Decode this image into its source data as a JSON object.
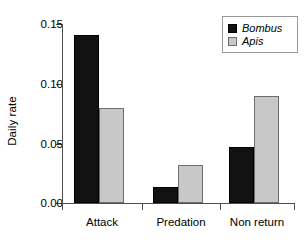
{
  "chart_data": {
    "type": "bar",
    "title": "",
    "subtitle": "",
    "xlabel": "",
    "ylabel": "Daily rate",
    "categories": [
      "Attack",
      "Predation",
      "Non return"
    ],
    "series": [
      {
        "name": "Bombus",
        "color": "#121212",
        "values": [
          0.141,
          0.013,
          0.047
        ]
      },
      {
        "name": "Apis",
        "color": "#c8c8c8",
        "values": [
          0.08,
          0.032,
          0.09
        ]
      }
    ],
    "ylim": [
      0.0,
      0.15
    ],
    "yticks": [
      0.0,
      0.05,
      0.1,
      0.15
    ],
    "ytick_labels": [
      "0.00",
      "0.05",
      "0.10",
      "0.15"
    ],
    "grid": false,
    "legend_position": "top-right",
    "legend_italic": true
  },
  "axis": {
    "y_label": "Daily rate",
    "y_ticks": [
      {
        "label": "0.15",
        "value": 0.15
      },
      {
        "label": "0.10",
        "value": 0.1
      },
      {
        "label": "0.05",
        "value": 0.05
      },
      {
        "label": "0.00",
        "value": 0.0
      }
    ],
    "x_categories": [
      {
        "label": "Attack"
      },
      {
        "label": "Predation"
      },
      {
        "label": "Non return"
      }
    ]
  },
  "legend": {
    "entries": [
      {
        "label": "Bombus",
        "swatch": "dark-square-icon",
        "color": "#121212"
      },
      {
        "label": "Apis",
        "swatch": "light-square-icon",
        "color": "#c8c8c8"
      }
    ]
  },
  "colors": {
    "bombus": "#121212",
    "apis": "#c8c8c8",
    "axis": "#4d4d4d",
    "background": "#ffffff"
  }
}
